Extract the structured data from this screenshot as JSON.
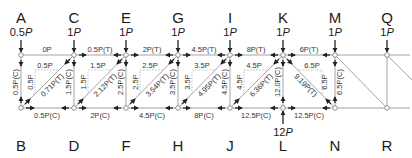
{
  "diagram": {
    "colors": {
      "member": "#9a9a9a",
      "text": "#1a1a1a",
      "arrow": "#222222",
      "joint": "#ffffff"
    },
    "top_nodes": [
      {
        "id": "A",
        "letter": "A",
        "load": "0.5",
        "unit": "P",
        "x": 21
      },
      {
        "id": "C",
        "letter": "C",
        "load": "1",
        "unit": "P",
        "x": 74
      },
      {
        "id": "E",
        "letter": "E",
        "load": "1",
        "unit": "P",
        "x": 126
      },
      {
        "id": "G",
        "letter": "G",
        "load": "1",
        "unit": "P",
        "x": 178
      },
      {
        "id": "I",
        "letter": "I",
        "load": "1",
        "unit": "P",
        "x": 230
      },
      {
        "id": "K",
        "letter": "K",
        "load": "1",
        "unit": "P",
        "x": 283
      },
      {
        "id": "M",
        "letter": "M",
        "load": "1",
        "unit": "P",
        "x": 335
      },
      {
        "id": "Q",
        "letter": "Q",
        "load": "1",
        "unit": "P",
        "x": 387
      }
    ],
    "bottom_nodes": [
      {
        "id": "B",
        "letter": "B",
        "x": 21
      },
      {
        "id": "D",
        "letter": "D",
        "x": 74
      },
      {
        "id": "F",
        "letter": "F",
        "x": 126
      },
      {
        "id": "H",
        "letter": "H",
        "x": 178
      },
      {
        "id": "J",
        "letter": "J",
        "x": 230
      },
      {
        "id": "L",
        "letter": "L",
        "x": 283
      },
      {
        "id": "N",
        "letter": "N",
        "x": 335
      },
      {
        "id": "R",
        "letter": "R",
        "x": 387
      }
    ],
    "reaction": {
      "node": "L",
      "value": "12",
      "unit": "P"
    },
    "top_chord_forces": [
      {
        "member": "AC",
        "label": "0P"
      },
      {
        "member": "CE",
        "label": "0.5P(T)"
      },
      {
        "member": "EG",
        "label": "2P(T)"
      },
      {
        "member": "GI",
        "label": "4.5P(T)"
      },
      {
        "member": "IK",
        "label": "8P(T)"
      },
      {
        "member": "KM",
        "label": "6P(T)"
      }
    ],
    "bottom_chord_forces": [
      {
        "member": "BD",
        "label": "0.5P(C)"
      },
      {
        "member": "DF",
        "label": "2P(C)"
      },
      {
        "member": "FH",
        "label": "4.5P(C)"
      },
      {
        "member": "HJ",
        "label": "8P(C)"
      },
      {
        "member": "JL",
        "label": "12.5P(C)"
      },
      {
        "member": "LN",
        "label": "12.5P(C)"
      }
    ],
    "vertical_forces": [
      {
        "member": "AB",
        "label": "0.5P(C)"
      },
      {
        "member": "CD",
        "label": "1.5P(C)"
      },
      {
        "member": "EF",
        "label": "2.5P(C)"
      },
      {
        "member": "GH",
        "label": "3.5P(C)"
      },
      {
        "member": "IJ",
        "label": "4.5P(C)"
      },
      {
        "member": "KL",
        "label": "12.0P(C)"
      },
      {
        "member": "MN",
        "label": "6.5P(C)"
      }
    ],
    "diagonal_forces": [
      {
        "member": "BC",
        "label": "0.71P(T)",
        "h_comp": "0.5P",
        "v_comp": "0.5P"
      },
      {
        "member": "DE",
        "label": "2.12P(T)",
        "h_comp": "1.5P",
        "v_comp": "1.5P"
      },
      {
        "member": "FG",
        "label": "3.54P(T)",
        "h_comp": "2.5P",
        "v_comp": "2.5P"
      },
      {
        "member": "HI",
        "label": "4.95P(T)",
        "h_comp": "3.5P",
        "v_comp": "3.5P"
      },
      {
        "member": "JK",
        "label": "6.36P(T)",
        "h_comp": "4.5P",
        "v_comp": "4.5P"
      },
      {
        "member": "KN",
        "label": "9.19P(T)",
        "h_comp": "6.5P",
        "v_comp": "6.5P"
      }
    ]
  }
}
